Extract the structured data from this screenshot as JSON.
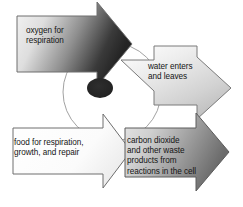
{
  "diagram": {
    "background_color": "#ffffff",
    "cell": {
      "name": "cell",
      "membrane_color": "#9a9a9a",
      "nucleus_color": "#232323",
      "nucleus_label": "nucleus"
    },
    "arrows": [
      {
        "id": "oxygen",
        "label": "oxygen for\nrespiration",
        "direction": "right",
        "kind": "single",
        "gradient_from": "#f2f2f2",
        "gradient_to": "#2b2b2b",
        "outline_color": "#6e6e6e"
      },
      {
        "id": "water",
        "label": "water enters\nand leaves",
        "direction": "both",
        "kind": "double",
        "gradient_from": "#ffffff",
        "gradient_to": "#c9c9c9",
        "outline_color": "#7a7a7a"
      },
      {
        "id": "food",
        "label": "food for respiration,\ngrowth, and repair",
        "direction": "right",
        "kind": "single",
        "gradient_from": "#ffffff",
        "gradient_to": "#f0f0f0",
        "outline_color": "#6e6e6e"
      },
      {
        "id": "waste",
        "label": "carbon dioxide\nand other waste\nproducts from\nreactions in the cell",
        "direction": "right",
        "kind": "single",
        "gradient_from": "#e3e3e3",
        "gradient_to": "#6f6f6f",
        "outline_color": "#5c5c5c"
      }
    ]
  }
}
